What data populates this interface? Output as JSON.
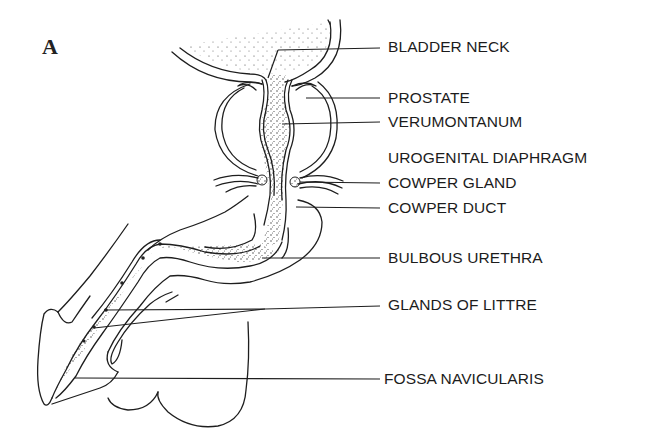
{
  "figure": {
    "panel_letter": "A",
    "labels": [
      {
        "id": "bladder-neck",
        "text": "BLADDER NECK",
        "y": 46
      },
      {
        "id": "prostate",
        "text": "PROSTATE",
        "y": 97
      },
      {
        "id": "verumontanum",
        "text": "VERUMONTANUM",
        "y": 121
      },
      {
        "id": "urogenital-diaphragm",
        "text": "UROGENITAL DIAPHRAGM",
        "y": 157
      },
      {
        "id": "cowper-gland",
        "text": "COWPER GLAND",
        "y": 182
      },
      {
        "id": "cowper-duct",
        "text": "COWPER DUCT",
        "y": 207
      },
      {
        "id": "bulbous-urethra",
        "text": "BULBOUS URETHRA",
        "y": 257
      },
      {
        "id": "glands-of-littre",
        "text": "GLANDS OF LITTRE",
        "y": 304
      },
      {
        "id": "fossa-navicularis",
        "text": "FOSSA NAVICULARIS",
        "y": 373
      }
    ]
  }
}
